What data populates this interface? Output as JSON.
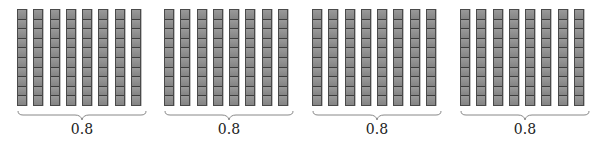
{
  "diagram": {
    "rod_color": "#8c8c8c",
    "groups": [
      {
        "rods": 8,
        "cubes_per_rod": 10,
        "label": "0.8",
        "x": 17
      },
      {
        "rods": 8,
        "cubes_per_rod": 10,
        "label": "0.8",
        "x": 164
      },
      {
        "rods": 8,
        "cubes_per_rod": 10,
        "label": "0.8",
        "x": 312
      },
      {
        "rods": 8,
        "cubes_per_rod": 10,
        "label": "0.8",
        "x": 460
      }
    ]
  }
}
